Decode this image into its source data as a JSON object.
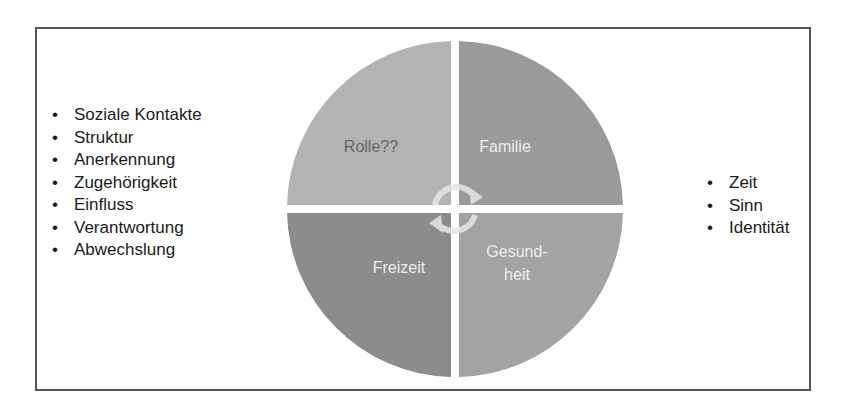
{
  "left_list": {
    "items": [
      "Soziale Kontakte",
      "Struktur",
      "Anerkennung",
      "Zugehörigkeit",
      "Einfluss",
      "Verantwortung",
      "Abwechslung"
    ]
  },
  "right_list": {
    "items": [
      "Zeit",
      "Sinn",
      "Identität"
    ]
  },
  "wheel": {
    "quadrants": [
      {
        "position": "top-left",
        "label": "Rolle??",
        "color": "#b3b3b3",
        "text_color": "#666666"
      },
      {
        "position": "top-right",
        "label": "Familie",
        "color": "#9a9a9a",
        "text_color": "#eeeeee"
      },
      {
        "position": "bottom-left",
        "label": "Freizeit",
        "color": "#8c8c8c",
        "text_color": "#eeeeee"
      },
      {
        "position": "bottom-right",
        "label_line1": "Gesund-",
        "label_line2": "heit",
        "color": "#a3a3a3",
        "text_color": "#eeeeee"
      }
    ],
    "center_icon": "cycle-arrows-icon"
  }
}
